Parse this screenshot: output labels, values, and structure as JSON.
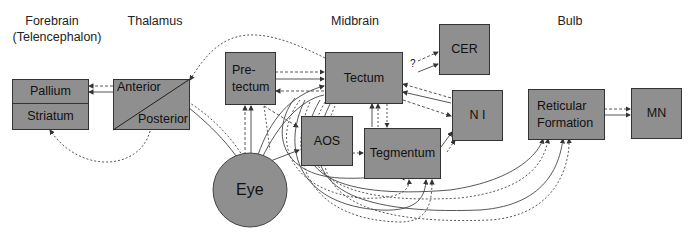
{
  "regions": {
    "forebrain": "Forebrain",
    "forebrain_sub": "(Telencephalon)",
    "thalamus": "Thalamus",
    "midbrain": "Midbrain",
    "bulb": "Bulb"
  },
  "nodes": {
    "pallium": "Pallium",
    "striatum": "Striatum",
    "anterior": "Anterior",
    "posterior": "Posterior",
    "pretectum_1": "Pre-",
    "pretectum_2": "tectum",
    "tectum": "Tectum",
    "cer": "CER",
    "aos": "AOS",
    "tegmentum": "Tegmentum",
    "ni": "N I",
    "reticular_1": "Reticular",
    "reticular_2": "Formation",
    "mn": "MN",
    "eye": "Eye"
  },
  "annotations": {
    "question_mark": "?"
  },
  "colors": {
    "box_fill": "#8f8f8f",
    "line": "#333333"
  }
}
